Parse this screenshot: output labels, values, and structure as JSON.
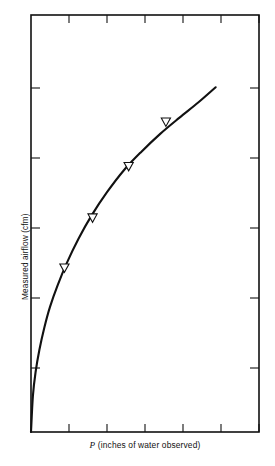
{
  "figure": {
    "background_color": "#ffffff",
    "axis_color": "#111111",
    "curve_color": "#111111",
    "marker_fill": "#ffffff"
  },
  "axis_labels": {
    "x_variable": "P",
    "x_rest": "(inches of water observed)",
    "x_full": "P (inches of water observed)",
    "y": "Measured airflow (cfm)"
  },
  "chart_data": {
    "type": "line",
    "title": "",
    "subtitle": "",
    "xlabel": "P (inches of water observed)",
    "ylabel": "Measured airflow (cfm)",
    "grid": false,
    "legend": null,
    "legend_position": "none",
    "axis_tick_labels_shown": false,
    "xlim": [
      0,
      6
    ],
    "ylim": [
      0,
      6
    ],
    "x_ticks": [
      1,
      2,
      3,
      4,
      5,
      6
    ],
    "y_ticks": [
      1,
      2,
      3,
      4,
      5
    ],
    "tick_direction": "in",
    "frame": "full-box",
    "series": [
      {
        "name": "fitted curve",
        "style": "solid line",
        "x": [
          0.0,
          0.05,
          0.12,
          0.22,
          0.35,
          0.5,
          0.7,
          0.95,
          1.25,
          1.6,
          2.0,
          2.45,
          2.9,
          3.4,
          3.9,
          4.4,
          4.86
        ],
        "y": [
          0.0,
          0.52,
          0.86,
          1.18,
          1.5,
          1.8,
          2.11,
          2.44,
          2.78,
          3.12,
          3.45,
          3.77,
          4.03,
          4.29,
          4.52,
          4.74,
          4.96
        ]
      },
      {
        "name": "measured data points",
        "style": "open down-triangle markers",
        "x": [
          0.88,
          1.62,
          2.57,
          3.55
        ],
        "y": [
          2.36,
          3.08,
          3.82,
          4.46
        ]
      }
    ]
  }
}
